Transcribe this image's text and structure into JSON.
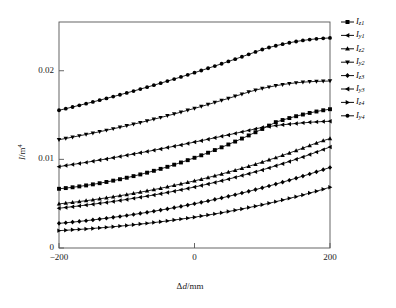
{
  "chart_data": {
    "type": "line",
    "title": "",
    "xlabel": "Δd/mm",
    "ylabel": "I/m4",
    "ylabel_parts": {
      "sym": "I",
      "slash": "/m",
      "exp": "4"
    },
    "xlabel_parts": {
      "delta": "Δ",
      "sym": "d",
      "unit": "/mm"
    },
    "xlim": [
      -200,
      200
    ],
    "ylim": [
      0,
      0.0255
    ],
    "xticks": [
      -200,
      0,
      200
    ],
    "xticklabels": [
      "−200",
      "0",
      "200"
    ],
    "yticks": [
      0,
      0.01,
      0.02
    ],
    "yticklabels": [
      "0",
      "0.01",
      "0.02"
    ],
    "grid": false,
    "legend_position": "outside top-right",
    "legend_entries": [
      "Iz1",
      "Iy1",
      "Iz2",
      "Iy2",
      "Iz3",
      "Iy3",
      "Iz4",
      "Iy4"
    ],
    "x": [
      -200,
      -190,
      -180,
      -170,
      -160,
      -150,
      -140,
      -130,
      -120,
      -110,
      -100,
      -90,
      -80,
      -70,
      -60,
      -50,
      -40,
      -30,
      -20,
      -10,
      0,
      10,
      20,
      30,
      40,
      50,
      60,
      70,
      80,
      90,
      100,
      110,
      120,
      130,
      140,
      150,
      160,
      170,
      180,
      190,
      200
    ],
    "series": [
      {
        "name": "Iz1",
        "label_sym": "I",
        "label_sub": "z1",
        "marker": "square",
        "color": "#000000",
        "values": [
          0.00668,
          0.00676,
          0.00685,
          0.00695,
          0.00706,
          0.00718,
          0.00731,
          0.00745,
          0.0076,
          0.00776,
          0.00793,
          0.00811,
          0.0083,
          0.0085,
          0.00871,
          0.00893,
          0.00916,
          0.0094,
          0.00965,
          0.00991,
          0.01018,
          0.01046,
          0.01075,
          0.01105,
          0.01136,
          0.01168,
          0.01201,
          0.01235,
          0.0127,
          0.01306,
          0.01343,
          0.01381,
          0.0142,
          0.01444,
          0.01466,
          0.01487,
          0.01506,
          0.01524,
          0.0154,
          0.01554,
          0.01566
        ]
      },
      {
        "name": "Iy1",
        "label_sym": "I",
        "label_sub": "y1",
        "marker": "left-triangle",
        "color": "#000000",
        "values": [
          0.00918,
          0.0093,
          0.00942,
          0.00954,
          0.00966,
          0.00979,
          0.00992,
          0.01005,
          0.01018,
          0.01032,
          0.01046,
          0.0106,
          0.01074,
          0.01088,
          0.01103,
          0.01118,
          0.01133,
          0.01148,
          0.01163,
          0.01179,
          0.01195,
          0.01211,
          0.01227,
          0.01243,
          0.0126,
          0.01276,
          0.01293,
          0.0131,
          0.01327,
          0.01344,
          0.01361,
          0.01371,
          0.01381,
          0.0139,
          0.01398,
          0.01405,
          0.01412,
          0.01418,
          0.01423,
          0.01427,
          0.0143
        ]
      },
      {
        "name": "Iz2",
        "label_sym": "I",
        "label_sub": "z2",
        "marker": "up-triangle",
        "color": "#000000",
        "values": [
          0.00498,
          0.00506,
          0.00515,
          0.00524,
          0.00534,
          0.00544,
          0.00555,
          0.00566,
          0.00578,
          0.0059,
          0.00603,
          0.00616,
          0.0063,
          0.00644,
          0.00659,
          0.00674,
          0.0069,
          0.00706,
          0.00723,
          0.0074,
          0.00758,
          0.00776,
          0.00795,
          0.00815,
          0.00835,
          0.00856,
          0.00877,
          0.00899,
          0.00922,
          0.00945,
          0.00969,
          0.00994,
          0.01019,
          0.01045,
          0.01072,
          0.01099,
          0.01127,
          0.01156,
          0.01185,
          0.01211,
          0.01235
        ]
      },
      {
        "name": "Iy2",
        "label_sym": "I",
        "label_sub": "y2",
        "marker": "down-triangle",
        "color": "#000000",
        "values": [
          0.01222,
          0.01236,
          0.01251,
          0.01266,
          0.01281,
          0.01296,
          0.01312,
          0.01328,
          0.01345,
          0.01362,
          0.01379,
          0.01397,
          0.01415,
          0.01434,
          0.01453,
          0.01472,
          0.01492,
          0.01512,
          0.01533,
          0.01554,
          0.01575,
          0.01597,
          0.01619,
          0.01642,
          0.01665,
          0.01688,
          0.01712,
          0.01736,
          0.0176,
          0.01781,
          0.018,
          0.01816,
          0.01831,
          0.01844,
          0.01855,
          0.01864,
          0.01871,
          0.01876,
          0.0188,
          0.01882,
          0.01884
        ]
      },
      {
        "name": "Iz3",
        "label_sym": "I",
        "label_sub": "z3",
        "marker": "diamond",
        "color": "#000000",
        "values": [
          0.00278,
          0.00285,
          0.00292,
          0.003,
          0.00308,
          0.00317,
          0.00326,
          0.00336,
          0.00346,
          0.00356,
          0.00367,
          0.00378,
          0.0039,
          0.00402,
          0.00415,
          0.00428,
          0.00441,
          0.00455,
          0.00469,
          0.00484,
          0.00499,
          0.00515,
          0.00531,
          0.00548,
          0.00565,
          0.00583,
          0.00601,
          0.0062,
          0.00639,
          0.00659,
          0.00679,
          0.007,
          0.00721,
          0.00743,
          0.00765,
          0.00788,
          0.00811,
          0.00835,
          0.00859,
          0.00884,
          0.00909
        ]
      },
      {
        "name": "Iy3",
        "label_sym": "I",
        "label_sub": "y3",
        "marker": "left-triangle",
        "color": "#000000",
        "values": [
          0.00449,
          0.00457,
          0.00466,
          0.00475,
          0.00484,
          0.00494,
          0.00504,
          0.00514,
          0.00525,
          0.00536,
          0.00548,
          0.0056,
          0.00572,
          0.00585,
          0.00598,
          0.00612,
          0.00626,
          0.00641,
          0.00656,
          0.00672,
          0.00688,
          0.00705,
          0.00722,
          0.0074,
          0.00758,
          0.00777,
          0.00797,
          0.00817,
          0.00838,
          0.00859,
          0.00881,
          0.00904,
          0.00927,
          0.00951,
          0.00976,
          0.01001,
          0.01027,
          0.01054,
          0.01082,
          0.0111,
          0.0114
        ]
      },
      {
        "name": "Iz4",
        "label_sym": "I",
        "label_sub": "z4",
        "marker": "right-triangle",
        "color": "#000000",
        "values": [
          0.00196,
          0.002,
          0.00205,
          0.0021,
          0.00215,
          0.00221,
          0.00227,
          0.00233,
          0.0024,
          0.00247,
          0.00254,
          0.00262,
          0.0027,
          0.00278,
          0.00287,
          0.00296,
          0.00306,
          0.00316,
          0.00326,
          0.00337,
          0.00348,
          0.0036,
          0.00372,
          0.00385,
          0.00398,
          0.00412,
          0.00426,
          0.00441,
          0.00456,
          0.00472,
          0.00488,
          0.00505,
          0.00523,
          0.00541,
          0.0056,
          0.00579,
          0.00599,
          0.0062,
          0.00641,
          0.00663,
          0.00686
        ]
      },
      {
        "name": "Iy4",
        "label_sym": "I",
        "label_sub": "y4",
        "marker": "circle",
        "color": "#000000",
        "values": [
          0.01554,
          0.01572,
          0.01591,
          0.0161,
          0.01629,
          0.01648,
          0.01668,
          0.01688,
          0.01708,
          0.01729,
          0.0175,
          0.01771,
          0.01793,
          0.01815,
          0.01837,
          0.0186,
          0.01883,
          0.01906,
          0.0193,
          0.01954,
          0.01978,
          0.02003,
          0.02028,
          0.02053,
          0.02079,
          0.02105,
          0.02131,
          0.02158,
          0.02185,
          0.02212,
          0.0224,
          0.02262,
          0.02282,
          0.023,
          0.02316,
          0.0233,
          0.02342,
          0.02352,
          0.0236,
          0.02366,
          0.0237
        ]
      }
    ]
  },
  "axes": {
    "frame": {
      "left": 59,
      "right": 330,
      "top": 22,
      "bottom": 248
    }
  }
}
